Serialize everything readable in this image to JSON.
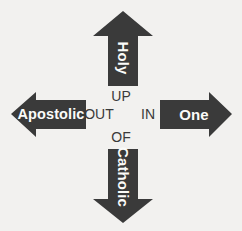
{
  "diagram": {
    "background_color": "#f2f1ef",
    "arrow_fill_color": "#3a3a3a",
    "arrow_label_color": "#fbfbf9",
    "center_word_color": "#3a3a3a",
    "arrows": [
      {
        "id": "up",
        "direction": "up",
        "label": "Holy",
        "label_rotation_deg": 90,
        "center_word": "UP"
      },
      {
        "id": "right",
        "direction": "right",
        "label": "One",
        "label_rotation_deg": 0,
        "center_word": "IN"
      },
      {
        "id": "down",
        "direction": "down",
        "label": "Catholic",
        "label_rotation_deg": 90,
        "center_word": "OF"
      },
      {
        "id": "left",
        "direction": "left",
        "label": "Apostolic",
        "label_rotation_deg": 0,
        "center_word": "OUT"
      }
    ],
    "center_words": {
      "up": "UP",
      "out": "OUT",
      "in": "IN",
      "of": "OF"
    }
  }
}
